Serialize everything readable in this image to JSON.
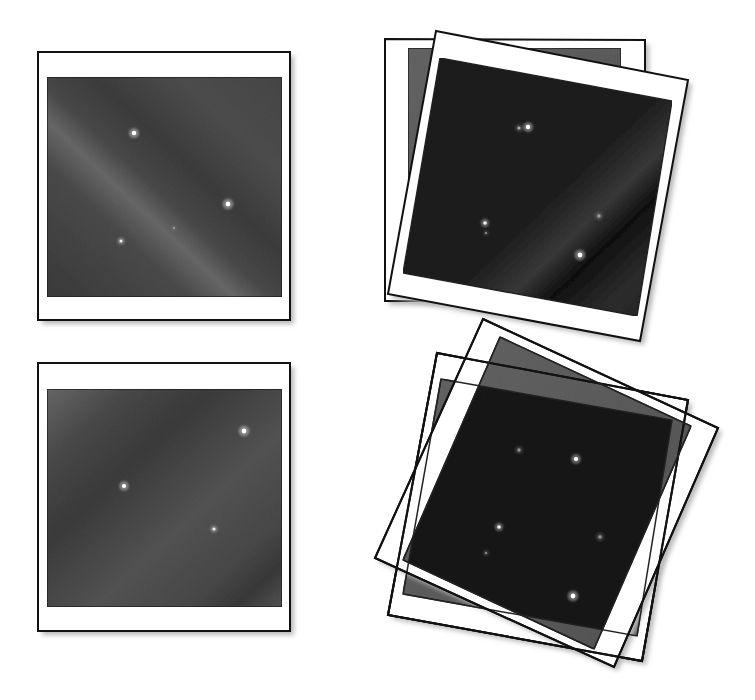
{
  "diagram": {
    "colors": {
      "background": "#ffffff",
      "frame_fill": "#ffffff",
      "frame_stroke": "#111111",
      "shadow": "#b8b8b8",
      "sky_light": "#6e6e6e",
      "sky_mid": "#4e4e4e",
      "sky_dark": "#3a3a3a",
      "overlap_gray": "#5a5a5a",
      "overlap_dark": "#1a1a1a",
      "star": "#ffffff"
    },
    "panels": [
      {
        "id": "top-left-single-frame",
        "frames": [
          {
            "outer": [
              [
                38,
                52
              ],
              [
                290,
                52
              ],
              [
                290,
                320
              ],
              [
                38,
                320
              ]
            ],
            "inner": [
              [
                47,
                77
              ],
              [
                282,
                77
              ],
              [
                282,
                297
              ],
              [
                47,
                297
              ]
            ],
            "sky": "band-a"
          }
        ],
        "stars": [
          {
            "x": 134,
            "y": 133,
            "r": 3.2,
            "o": 1
          },
          {
            "x": 228,
            "y": 204,
            "r": 3.4,
            "o": 1
          },
          {
            "x": 121,
            "y": 241,
            "r": 2.2,
            "o": 0.85
          },
          {
            "x": 174,
            "y": 228,
            "r": 1.4,
            "o": 0.35
          }
        ]
      },
      {
        "id": "bottom-left-single-frame",
        "frames": [
          {
            "outer": [
              [
                38,
                363
              ],
              [
                290,
                363
              ],
              [
                290,
                631
              ],
              [
                38,
                631
              ]
            ],
            "inner": [
              [
                47,
                389
              ],
              [
                282,
                389
              ],
              [
                282,
                607
              ],
              [
                47,
                607
              ]
            ],
            "sky": "band-b"
          }
        ],
        "stars": [
          {
            "x": 244,
            "y": 431,
            "r": 3.4,
            "o": 1
          },
          {
            "x": 124,
            "y": 486,
            "r": 3.0,
            "o": 1
          },
          {
            "x": 214,
            "y": 529,
            "r": 2.2,
            "o": 0.85
          }
        ]
      },
      {
        "id": "top-right-stacked-frames",
        "frames": [
          {
            "outer": [
              [
                385,
                39
              ],
              [
                645,
                40
              ],
              [
                645,
                301
              ],
              [
                385,
                301
              ]
            ],
            "inner": [
              [
                408,
                48
              ],
              [
                621,
                48
              ],
              [
                621,
                294
              ],
              [
                408,
                294
              ]
            ],
            "sky": "gray"
          },
          {
            "outer": [
              [
                436,
                31
              ],
              [
                688,
                80
              ],
              [
                640,
                341
              ],
              [
                388,
                294
              ]
            ],
            "inner": [
              [
                440,
                58
              ],
              [
                672,
                101
              ],
              [
                637,
                316
              ],
              [
                403,
                273
              ]
            ],
            "sky": "dark-band"
          }
        ],
        "stars": [
          {
            "x": 519,
            "y": 128,
            "r": 2.2,
            "o": 0.55
          },
          {
            "x": 528,
            "y": 127,
            "r": 3.2,
            "o": 1
          },
          {
            "x": 485,
            "y": 223,
            "r": 2.6,
            "o": 0.9
          },
          {
            "x": 486,
            "y": 233,
            "r": 1.6,
            "o": 0.45
          },
          {
            "x": 599,
            "y": 216,
            "r": 2.4,
            "o": 0.45
          },
          {
            "x": 580,
            "y": 255,
            "r": 3.4,
            "o": 1
          }
        ]
      },
      {
        "id": "bottom-right-stacked-frames",
        "frames": [
          {
            "outer": [
              [
                437,
                353
              ],
              [
                688,
                400
              ],
              [
                642,
                661
              ],
              [
                388,
                615
              ]
            ],
            "inner": [
              [
                441,
                379
              ],
              [
                672,
                420
              ],
              [
                637,
                636
              ],
              [
                403,
                594
              ]
            ],
            "sky": "gray"
          },
          {
            "outer": [
              [
                483,
                319
              ],
              [
                718,
                428
              ],
              [
                614,
                667
              ],
              [
                375,
                558
              ]
            ],
            "inner": [
              [
                500,
                337
              ],
              [
                691,
                426
              ],
              [
                594,
                649
              ],
              [
                403,
                560
              ]
            ],
            "sky": "gray"
          },
          {
            "outer": [
              [
                437,
                353
              ],
              [
                688,
                400
              ],
              [
                642,
                661
              ],
              [
                388,
                615
              ]
            ],
            "inner": [
              [
                441,
                379
              ],
              [
                672,
                420
              ],
              [
                637,
                636
              ],
              [
                403,
                594
              ]
            ],
            "sky": "none"
          }
        ],
        "overlap_clip": [
          [
            500,
            337
          ],
          [
            691,
            426
          ],
          [
            637,
            636
          ],
          [
            403,
            594
          ]
        ],
        "stars": [
          {
            "x": 519,
            "y": 450,
            "r": 2.4,
            "o": 0.45
          },
          {
            "x": 576,
            "y": 459,
            "r": 3.0,
            "o": 1
          },
          {
            "x": 499,
            "y": 527,
            "r": 2.6,
            "o": 0.9
          },
          {
            "x": 486,
            "y": 553,
            "r": 1.8,
            "o": 0.4
          },
          {
            "x": 600,
            "y": 537,
            "r": 2.6,
            "o": 0.45
          },
          {
            "x": 573,
            "y": 596,
            "r": 3.4,
            "o": 1
          }
        ]
      }
    ]
  }
}
